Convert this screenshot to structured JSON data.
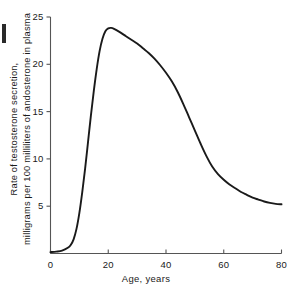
{
  "chart_data": {
    "type": "line",
    "title": "",
    "xlabel": "Age, years",
    "ylabel_line1": "Rate of testosterone secretion,",
    "ylabel_line2": "milligrams per 100 milliliters of andosterone in plasma",
    "xlim": [
      0,
      80
    ],
    "ylim": [
      0,
      25
    ],
    "xticks": [
      0,
      20,
      40,
      60,
      80
    ],
    "xtick_labels": [
      "0",
      "20",
      "40",
      "60",
      "80"
    ],
    "yticks": [
      5,
      10,
      15,
      20,
      25
    ],
    "ytick_labels": [
      "5",
      "10",
      "15",
      "20",
      "25"
    ],
    "grid": false,
    "legend": "none",
    "series": [
      {
        "name": "Testosterone secretion rate",
        "x": [
          0,
          2,
          4,
          6,
          7,
          8,
          9,
          10,
          11,
          12,
          13,
          14,
          15,
          16,
          17,
          18,
          19,
          20,
          21,
          22,
          24,
          26,
          28,
          30,
          32,
          34,
          36,
          38,
          40,
          42,
          44,
          46,
          48,
          50,
          52,
          54,
          56,
          58,
          60,
          62,
          64,
          66,
          68,
          70,
          72,
          74,
          76,
          78,
          80
        ],
        "y": [
          0.15,
          0.2,
          0.3,
          0.6,
          0.9,
          1.5,
          2.6,
          4.3,
          6.5,
          9.0,
          11.8,
          14.6,
          17.2,
          19.5,
          21.4,
          22.7,
          23.5,
          23.8,
          23.85,
          23.75,
          23.4,
          23.0,
          22.6,
          22.2,
          21.7,
          21.2,
          20.6,
          19.9,
          19.1,
          18.2,
          17.1,
          15.8,
          14.4,
          13.0,
          11.6,
          10.3,
          9.2,
          8.4,
          7.8,
          7.3,
          6.9,
          6.5,
          6.2,
          5.9,
          5.7,
          5.5,
          5.35,
          5.25,
          5.2
        ]
      }
    ],
    "annotations": {
      "peak_value": 23.85,
      "peak_age": 21,
      "plateau_value": 5.2
    },
    "colors": {
      "line": "#1a1a1a",
      "axis": "#555555",
      "background": "#ffffff"
    }
  }
}
